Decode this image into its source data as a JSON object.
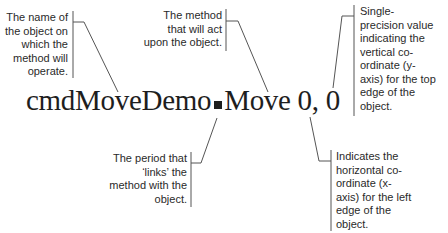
{
  "statement": {
    "object_name": "cmdMoveDemo",
    "method": "Move",
    "args": "0, 0"
  },
  "annotations": {
    "object": "The name of\nthe object on\nwhich the\nmethod will\noperate.",
    "method": "The method\nthat will act\nupon the object.",
    "top": "Single-\nprecision value\nindicating the\nvertical co-\nordinate (y-\naxis) for the top\nedge of the\nobject.",
    "period": "The period that\n‘links’ the\nmethod with the\nobject.",
    "left": "Indicates the\nhorizontal co-\nordinate (x-\naxis) for the left\nedge of the\nobject."
  },
  "colors": {
    "text": "#1e1e1e",
    "leader_line": "#555555"
  }
}
